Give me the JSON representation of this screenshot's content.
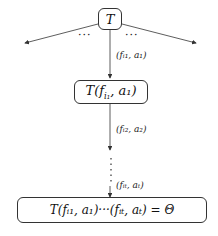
{
  "diagram": {
    "root": {
      "label": "T"
    },
    "node1": {
      "label_main": "T(f",
      "label_sub": "i₁",
      "label_rest": ", a₁)"
    },
    "final": {
      "label": "T(fᵢ₁, a₁)···(fᵢₜ, aₜ) = Θ"
    },
    "edges": {
      "e1": "(fᵢ₁, a₁)",
      "e2": "(fᵢ₂, a₂)",
      "et": "(fᵢₜ, aₜ)"
    },
    "ellipsis_left": "···",
    "ellipsis_right": "···",
    "vertical_ellipsis": "⋮"
  }
}
